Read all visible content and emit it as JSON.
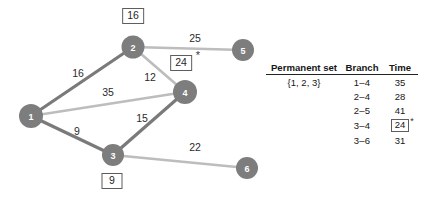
{
  "graph": {
    "nodes": [
      {
        "id": "1",
        "label": "1",
        "cx": 31,
        "cy": 116,
        "r": 12
      },
      {
        "id": "2",
        "label": "2",
        "cx": 133,
        "cy": 47,
        "r": 11.5
      },
      {
        "id": "3",
        "label": "3",
        "cx": 113,
        "cy": 155,
        "r": 11
      },
      {
        "id": "4",
        "label": "4",
        "cx": 185,
        "cy": 92,
        "r": 12
      },
      {
        "id": "5",
        "label": "5",
        "cx": 243,
        "cy": 50,
        "r": 11
      },
      {
        "id": "6",
        "label": "6",
        "cx": 247,
        "cy": 168,
        "r": 11
      }
    ],
    "edges": [
      {
        "from": "1",
        "to": "2",
        "weight": "16",
        "style": "dark",
        "lx": 78,
        "ly": 73
      },
      {
        "from": "1",
        "to": "4",
        "weight": "35",
        "style": "light",
        "lx": 108,
        "ly": 92
      },
      {
        "from": "1",
        "to": "3",
        "weight": "9",
        "style": "dark",
        "lx": 77,
        "ly": 131
      },
      {
        "from": "2",
        "to": "4",
        "weight": "12",
        "style": "light",
        "lx": 150,
        "ly": 77
      },
      {
        "from": "2",
        "to": "5",
        "weight": "25",
        "style": "light",
        "lx": 195,
        "ly": 38
      },
      {
        "from": "3",
        "to": "4",
        "weight": "15",
        "style": "dark",
        "lx": 142,
        "ly": 118
      },
      {
        "from": "3",
        "to": "6",
        "weight": "22",
        "style": "light",
        "lx": 195,
        "ly": 147
      }
    ],
    "boxed_labels": [
      {
        "for_node": "2",
        "text": "16",
        "lx": 133,
        "ly": 16,
        "starred": false
      },
      {
        "for_node": "4",
        "text": "24",
        "lx": 181,
        "ly": 63,
        "starred": true,
        "star_x": 198,
        "star_y": 55
      },
      {
        "for_node": "3",
        "text": "9",
        "lx": 112,
        "ly": 181,
        "starred": false
      }
    ],
    "colors": {
      "node_fill": "#7d7d7d",
      "node_text": "#ffffff",
      "edge_dark": "#7a7a7a",
      "edge_light": "#bdbdbd",
      "label_text": "#2b2b2b",
      "box_border": "#5d5d5d"
    }
  },
  "table": {
    "headers": {
      "permanent": "Permanent set",
      "branch": "Branch",
      "time": "Time"
    },
    "rows": [
      {
        "permanent": "{1, 2, 3}",
        "branch": "1–4",
        "time": "35",
        "boxed": false,
        "starred": false
      },
      {
        "permanent": "",
        "branch": "2–4",
        "time": "28",
        "boxed": false,
        "starred": false
      },
      {
        "permanent": "",
        "branch": "2–5",
        "time": "41",
        "boxed": false,
        "starred": false
      },
      {
        "permanent": "",
        "branch": "3–4",
        "time": "24",
        "boxed": true,
        "starred": true
      },
      {
        "permanent": "",
        "branch": "3–6",
        "time": "31",
        "boxed": false,
        "starred": false
      }
    ]
  }
}
